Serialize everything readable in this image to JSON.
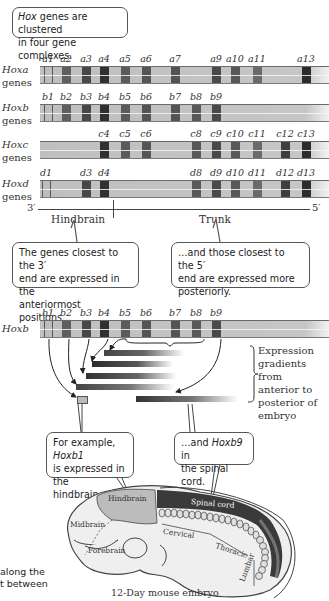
{
  "top_callout": {
    "italic": "Hox",
    "text_line1": " genes are clustered",
    "text_line2": "in four gene complexes."
  },
  "clusters": [
    {
      "name": "Hoxa",
      "sub": "genes",
      "genes": [
        {
          "label": "a1",
          "x": 48,
          "shade": "outline"
        },
        {
          "label": "a2",
          "x": 66,
          "shade": "#5e5e5e"
        },
        {
          "label": "a3",
          "x": 86,
          "shade": "#474747"
        },
        {
          "label": "a4",
          "x": 104,
          "shade": "#303030"
        },
        {
          "label": "a5",
          "x": 125,
          "shade": "#5a5a5a"
        },
        {
          "label": "a6",
          "x": 146,
          "shade": "#555555"
        },
        {
          "label": "a7",
          "x": 175,
          "shade": "#535353"
        },
        {
          "label": "a9",
          "x": 216,
          "shade": "#4a4a4a"
        },
        {
          "label": "a10",
          "x": 235,
          "shade": "#585858"
        },
        {
          "label": "a11",
          "x": 257,
          "shade": "#6a6a6a"
        },
        {
          "label": "a13",
          "x": 306,
          "shade": "#2c2c2c"
        }
      ]
    },
    {
      "name": "Hoxb",
      "sub": "genes",
      "genes": [
        {
          "label": "b1",
          "x": 48,
          "shade": "outline"
        },
        {
          "label": "b2",
          "x": 66,
          "shade": "#5e5e5e"
        },
        {
          "label": "b3",
          "x": 86,
          "shade": "#474747"
        },
        {
          "label": "b4",
          "x": 104,
          "shade": "#303030"
        },
        {
          "label": "b5",
          "x": 125,
          "shade": "#5a5a5a"
        },
        {
          "label": "b6",
          "x": 146,
          "shade": "#555555"
        },
        {
          "label": "b7",
          "x": 175,
          "shade": "#535353"
        },
        {
          "label": "b8",
          "x": 196,
          "shade": "#585858"
        },
        {
          "label": "b9",
          "x": 216,
          "shade": "#4a4a4a"
        }
      ]
    },
    {
      "name": "Hoxc",
      "sub": "genes",
      "genes": [
        {
          "label": "c4",
          "x": 104,
          "shade": "#303030"
        },
        {
          "label": "c5",
          "x": 125,
          "shade": "#5a5a5a"
        },
        {
          "label": "c6",
          "x": 146,
          "shade": "#555555"
        },
        {
          "label": "c8",
          "x": 196,
          "shade": "#585858"
        },
        {
          "label": "c9",
          "x": 216,
          "shade": "#4a4a4a"
        },
        {
          "label": "c10",
          "x": 235,
          "shade": "#585858"
        },
        {
          "label": "c11",
          "x": 257,
          "shade": "#6a6a6a"
        },
        {
          "label": "c12",
          "x": 285,
          "shade": "#3e3e3e"
        },
        {
          "label": "c13",
          "x": 306,
          "shade": "#2c2c2c"
        }
      ]
    },
    {
      "name": "Hoxd",
      "sub": "genes",
      "genes": [
        {
          "label": "d1",
          "x": 46,
          "shade": "outline"
        },
        {
          "label": "d3",
          "x": 86,
          "shade": "#474747"
        },
        {
          "label": "d4",
          "x": 104,
          "shade": "#303030"
        },
        {
          "label": "d8",
          "x": 196,
          "shade": "#585858"
        },
        {
          "label": "d9",
          "x": 216,
          "shade": "#4a4a4a"
        },
        {
          "label": "d10",
          "x": 235,
          "shade": "#585858"
        },
        {
          "label": "d11",
          "x": 257,
          "shade": "#6a6a6a"
        },
        {
          "label": "d12",
          "x": 285,
          "shade": "#3e3e3e"
        },
        {
          "label": "d13",
          "x": 306,
          "shade": "#2c2c2c"
        }
      ]
    }
  ],
  "axis": {
    "left": "3′",
    "right": "5′",
    "region_left": "Hindbrain",
    "region_right": "Trunk"
  },
  "callout_3prime": {
    "line1": "The genes closest to the 3′",
    "line2": "end are expressed in the",
    "line3": "anteriormost positions…"
  },
  "callout_5prime": {
    "line1": "…and those closest to the 5′",
    "line2": "end are expressed more",
    "line3": "posteriorly."
  },
  "hoxb_detail": {
    "name": "Hoxb",
    "genes": [
      {
        "label": "b1",
        "x": 48,
        "shade": "outline"
      },
      {
        "label": "b2",
        "x": 66,
        "shade": "#5e5e5e"
      },
      {
        "label": "b3",
        "x": 86,
        "shade": "#474747"
      },
      {
        "label": "b4",
        "x": 104,
        "shade": "#303030"
      },
      {
        "label": "b5",
        "x": 125,
        "shade": "#5a5a5a"
      },
      {
        "label": "b6",
        "x": 146,
        "shade": "#555555"
      },
      {
        "label": "b7",
        "x": 175,
        "shade": "#535353"
      },
      {
        "label": "b8",
        "x": 196,
        "shade": "#585858"
      },
      {
        "label": "b9",
        "x": 216,
        "shade": "#4a4a4a"
      }
    ],
    "gradients_label": {
      "line1": "Expression",
      "line2": "gradients from",
      "line3": "anterior to",
      "line4": "posterior of",
      "line5": "embryo"
    }
  },
  "callout_hoxb1": {
    "line1_pre": "For example, ",
    "line1_italic": "Hoxb1",
    "line2": "is expressed in the",
    "line3": "hindbrain…"
  },
  "callout_hoxb9": {
    "line1_pre": "…and ",
    "line1_italic": "Hoxb9",
    "line1_post": " in",
    "line2": "the spinal cord."
  },
  "embryo": {
    "hindbrain": "Hindbrain",
    "spinal_cord": "Spinal cord",
    "midbrain": "Midbrain",
    "forebrain": "Forebrain",
    "cervical": "Cervical",
    "thoracic": "Thoracic",
    "lumbar": "Lumbar",
    "caption": "12-Day mouse embryo"
  },
  "cut_text": {
    "line1": "along the",
    "line2": "t between"
  }
}
